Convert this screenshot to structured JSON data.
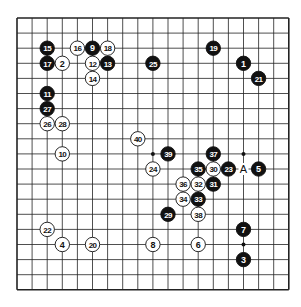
{
  "diagram": {
    "type": "go-board",
    "size": 19,
    "origin": {
      "x": 17,
      "y": 18
    },
    "spacing": 15.1,
    "star_points": [
      [
        3,
        3
      ],
      [
        9,
        3
      ],
      [
        15,
        3
      ],
      [
        3,
        9
      ],
      [
        9,
        9
      ],
      [
        15,
        9
      ],
      [
        3,
        15
      ],
      [
        9,
        15
      ],
      [
        15,
        15
      ]
    ],
    "stones": [
      {
        "n": "1",
        "color": "black",
        "col": 15,
        "row": 3
      },
      {
        "n": "2",
        "color": "white",
        "col": 3,
        "row": 3
      },
      {
        "n": "3",
        "color": "black",
        "col": 15,
        "row": 16
      },
      {
        "n": "4",
        "color": "white",
        "col": 3,
        "row": 15
      },
      {
        "n": "5",
        "color": "black",
        "col": 16,
        "row": 10
      },
      {
        "n": "6",
        "color": "white",
        "col": 12,
        "row": 15
      },
      {
        "n": "7",
        "color": "black",
        "col": 15,
        "row": 14
      },
      {
        "n": "8",
        "color": "white",
        "col": 9,
        "row": 15
      },
      {
        "n": "9",
        "color": "black",
        "col": 5,
        "row": 2
      },
      {
        "n": "10",
        "color": "white",
        "col": 3,
        "row": 9
      },
      {
        "n": "11",
        "color": "black",
        "col": 2,
        "row": 5
      },
      {
        "n": "12",
        "color": "white",
        "col": 5,
        "row": 3
      },
      {
        "n": "13",
        "color": "black",
        "col": 6,
        "row": 3
      },
      {
        "n": "14",
        "color": "white",
        "col": 5,
        "row": 4
      },
      {
        "n": "15",
        "color": "black",
        "col": 2,
        "row": 2
      },
      {
        "n": "16",
        "color": "white",
        "col": 4,
        "row": 2
      },
      {
        "n": "17",
        "color": "black",
        "col": 2,
        "row": 3
      },
      {
        "n": "18",
        "color": "white",
        "col": 6,
        "row": 2
      },
      {
        "n": "19",
        "color": "black",
        "col": 13,
        "row": 2
      },
      {
        "n": "20",
        "color": "white",
        "col": 5,
        "row": 15
      },
      {
        "n": "21",
        "color": "black",
        "col": 16,
        "row": 4
      },
      {
        "n": "22",
        "color": "white",
        "col": 2,
        "row": 14
      },
      {
        "n": "23",
        "color": "black",
        "col": 14,
        "row": 10
      },
      {
        "n": "24",
        "color": "white",
        "col": 9,
        "row": 10
      },
      {
        "n": "25",
        "color": "black",
        "col": 9,
        "row": 3
      },
      {
        "n": "26",
        "color": "white",
        "col": 2,
        "row": 7
      },
      {
        "n": "27",
        "color": "black",
        "col": 2,
        "row": 6
      },
      {
        "n": "28",
        "color": "white",
        "col": 3,
        "row": 7
      },
      {
        "n": "29",
        "color": "black",
        "col": 10,
        "row": 13
      },
      {
        "n": "30",
        "color": "white",
        "col": 13,
        "row": 10
      },
      {
        "n": "31",
        "color": "black",
        "col": 13,
        "row": 11
      },
      {
        "n": "32",
        "color": "white",
        "col": 12,
        "row": 11
      },
      {
        "n": "33",
        "color": "black",
        "col": 12,
        "row": 12
      },
      {
        "n": "34",
        "color": "white",
        "col": 11,
        "row": 12
      },
      {
        "n": "35",
        "color": "black",
        "col": 12,
        "row": 10
      },
      {
        "n": "36",
        "color": "white",
        "col": 11,
        "row": 11
      },
      {
        "n": "37",
        "color": "black",
        "col": 13,
        "row": 9
      },
      {
        "n": "38",
        "color": "white",
        "col": 12,
        "row": 13
      },
      {
        "n": "39",
        "color": "black",
        "col": 10,
        "row": 9
      },
      {
        "n": "40",
        "color": "white",
        "col": 8,
        "row": 8
      }
    ],
    "labels": [
      {
        "text": "A",
        "col": 15,
        "row": 10
      }
    ]
  }
}
